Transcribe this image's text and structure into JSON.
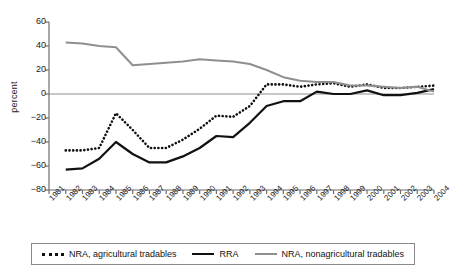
{
  "chart_data": {
    "type": "line",
    "title": "",
    "xlabel": "year",
    "ylabel": "percent",
    "ylim": [
      -80,
      60
    ],
    "yticks": [
      60,
      40,
      20,
      0,
      -20,
      -40,
      -60,
      -80
    ],
    "ytick_labels": [
      "60",
      "40",
      "20",
      "0",
      "−20",
      "−40",
      "−60",
      "−80"
    ],
    "grid": false,
    "legend_position": "bottom",
    "categories": [
      "1981",
      "1982",
      "1983",
      "1984",
      "1985",
      "1986",
      "1987",
      "1988",
      "1989",
      "1990",
      "1991",
      "1992",
      "1993",
      "1994",
      "1995",
      "1996",
      "1997",
      "1998",
      "1999",
      "2000",
      "2001",
      "2002",
      "2003",
      "2004"
    ],
    "x": [
      1981,
      1982,
      1983,
      1984,
      1985,
      1986,
      1987,
      1988,
      1989,
      1990,
      1991,
      1992,
      1993,
      1994,
      1995,
      1996,
      1997,
      1998,
      1999,
      2000,
      2001,
      2002,
      2003,
      2004
    ],
    "series": [
      {
        "name": "NRA, agricultural tradables",
        "style": "dotted",
        "color": "#111111",
        "values": [
          null,
          -47,
          -47,
          -45,
          -16,
          -30,
          -45,
          -45,
          -38,
          -29,
          -18,
          -19,
          -10,
          8,
          8,
          6,
          8,
          9,
          6,
          8,
          5,
          5,
          6,
          7
        ]
      },
      {
        "name": "RRA",
        "style": "solid",
        "color": "#111111",
        "values": [
          null,
          -63,
          -62,
          -54,
          -40,
          -50,
          -57,
          -57,
          -52,
          -45,
          -35,
          -36,
          -24,
          -10,
          -6,
          -6,
          2,
          0,
          0,
          3,
          -1,
          -1,
          1,
          4
        ]
      },
      {
        "name": "NRA, nonagricultural tradables",
        "style": "solid",
        "color": "#8f8f8f",
        "values": [
          null,
          43,
          42,
          40,
          39,
          24,
          25,
          26,
          27,
          29,
          28,
          27,
          25,
          20,
          14,
          11,
          10,
          10,
          7,
          7,
          6,
          5,
          6,
          2
        ]
      }
    ]
  },
  "legend": {
    "items": [
      {
        "label": "NRA, agricultural tradables",
        "marker": "dotted-line-swatch"
      },
      {
        "label": "RRA",
        "marker": "solid-dark-line-swatch"
      },
      {
        "label": "NRA, nonagricultural tradables",
        "marker": "solid-gray-line-swatch"
      }
    ]
  },
  "axes": {
    "y_title": "percent",
    "x_title": "year"
  }
}
